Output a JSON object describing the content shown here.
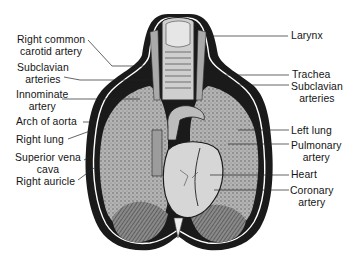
{
  "figure": {
    "colors": {
      "ink": "#111111",
      "lung": "#9a9a9a",
      "heart": "#d2d2d2",
      "diaphragm": "#6e6e6e",
      "background": "#ffffff"
    }
  },
  "labels_left": [
    {
      "line1": "Right common",
      "line2": "carotid artery"
    },
    {
      "line1": "Subclavian",
      "line2": "arteries"
    },
    {
      "line1": "Innominate",
      "line2": "artery"
    },
    {
      "line1": "Arch of aorta"
    },
    {
      "line1": "Right lung"
    },
    {
      "line1": "Superior vena",
      "line2": "cava"
    },
    {
      "line1": "Right auricle"
    }
  ],
  "labels_right": [
    {
      "line1": "Larynx"
    },
    {
      "line1": "Trachea"
    },
    {
      "line1": "Subclavian",
      "line2": "arteries"
    },
    {
      "line1": "Left lung"
    },
    {
      "line1": "Pulmonary",
      "line2": "artery"
    },
    {
      "line1": "Heart"
    },
    {
      "line1": "Coronary",
      "line2": "artery"
    }
  ]
}
